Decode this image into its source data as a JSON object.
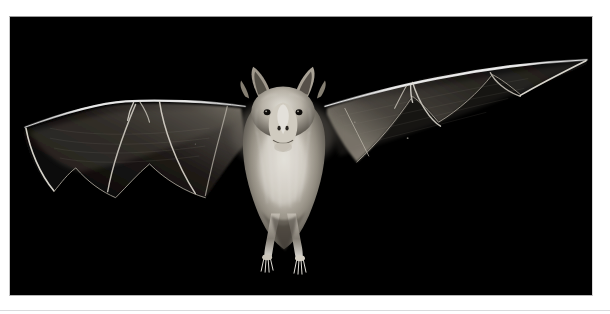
{
  "page": {
    "background_color": "#ffffff",
    "width": 610,
    "height": 314
  },
  "photo": {
    "name": "bat-in-flight-photograph",
    "alt_text": "",
    "background_color": "#000000",
    "border_color": "#c0c0c0",
    "subject": "bat",
    "subject_pose": "wings-fully-spread-frontal-flight",
    "lighting": "flash-on-black-background",
    "palette": {
      "background": "#000000",
      "fur_highlight": "#f2efe9",
      "fur_midtone": "#b9b3a8",
      "fur_shadow": "#595349",
      "membrane_dark": "#0e0e0e",
      "membrane_mid": "#3a3833",
      "bone_bright": "#ffffff",
      "bone_dim": "#cfcabf"
    },
    "anatomy": {
      "head": "ears, nose-leaf, eyes",
      "wings": "left wing and right wing, membranes with finger bones",
      "legs": "two hind legs with splayed toes and claws"
    }
  },
  "footer": {
    "rule_color": "#d9dadc",
    "caption": ""
  }
}
